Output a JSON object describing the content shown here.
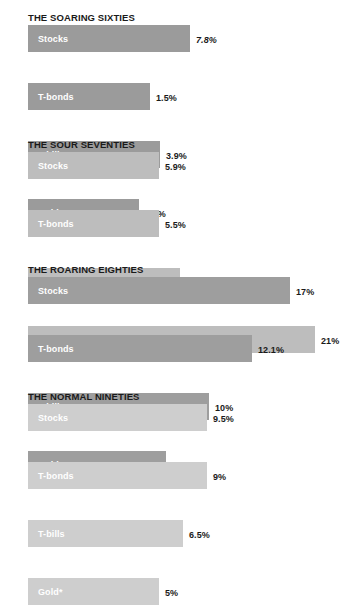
{
  "chart_data": {
    "type": "bar",
    "title": "",
    "xlabel": "",
    "ylabel": "",
    "orientation": "horizontal",
    "grid": false,
    "legend": "none",
    "note": "Four decade panels; each panel lists annualized returns for four asset classes. Bar lengths are drawn per-panel and are not on a single shared scale.",
    "categories": [
      "Stocks",
      "T-bonds",
      "T-bills",
      "Gold"
    ],
    "panels": [
      {
        "title": "THE SOARING SIXTIES",
        "bar_color": "#9b9b9b",
        "bars": [
          {
            "label": "Stocks",
            "value": 7.8,
            "value_label": "7.8%",
            "italic": true,
            "bar_px": 162,
            "value_x_px": 196
          },
          {
            "label": "T-bonds",
            "value": 1.5,
            "value_label": "1.5%",
            "italic": false,
            "bar_px": 122,
            "value_x_px": 156
          },
          {
            "label": "T-bills",
            "value": 3.9,
            "value_label": "3.9%",
            "italic": false,
            "bar_px": 132,
            "value_x_px": 166
          },
          {
            "label": "Gold*",
            "value": 2.2,
            "value_label": "2.2%",
            "italic": false,
            "bar_px": 111,
            "value_x_px": 145
          }
        ]
      },
      {
        "title": "THE SOUR SEVENTIES",
        "bar_color": "#bdbdbd",
        "bars": [
          {
            "label": "Stocks",
            "value": 5.9,
            "value_label": "5.9%",
            "italic": false,
            "bar_px": 131,
            "value_x_px": 165
          },
          {
            "label": "T-bonds",
            "value": 5.5,
            "value_label": "5.5%",
            "italic": false,
            "bar_px": 131,
            "value_x_px": 165
          },
          {
            "label": "T-bills",
            "value": 6.3,
            "value_label": "6.3%",
            "italic": false,
            "bar_px": 152,
            "value_x_px": 186
          },
          {
            "label": "Gold",
            "value": 21,
            "value_label": "21%",
            "italic": false,
            "bar_px": 287,
            "value_x_px": 321
          }
        ]
      },
      {
        "title": "THE ROARING EIGHTIES",
        "bar_color": "#9e9e9e",
        "bars": [
          {
            "label": "Stocks",
            "value": 17,
            "value_label": "17%",
            "italic": false,
            "bar_px": 262,
            "value_x_px": 296
          },
          {
            "label": "T-bonds",
            "value": 12.1,
            "value_label": "12.1%",
            "italic": false,
            "bar_px": 224,
            "value_x_px": 258
          },
          {
            "label": "T-bills",
            "value": 10,
            "value_label": "10%",
            "italic": false,
            "bar_px": 181,
            "value_x_px": 215
          },
          {
            "label": "Gold",
            "value": 2.8,
            "value_label": "2.8%",
            "italic": false,
            "bar_px": 138,
            "value_x_px": 172
          }
        ]
      },
      {
        "title": "THE NORMAL NINETIES",
        "bar_color": "#cecece",
        "bars": [
          {
            "label": "Stocks",
            "value": 9.5,
            "value_label": "9.5%",
            "italic": false,
            "bar_px": 179,
            "value_x_px": 213
          },
          {
            "label": "T-bonds",
            "value": 9,
            "value_label": "9%",
            "italic": false,
            "bar_px": 179,
            "value_x_px": 213
          },
          {
            "label": "T-bills",
            "value": 6.5,
            "value_label": "6.5%",
            "italic": false,
            "bar_px": 155,
            "value_x_px": 189
          },
          {
            "label": "Gold*",
            "value": 5,
            "value_label": "5%",
            "italic": false,
            "bar_px": 131,
            "value_x_px": 165
          }
        ]
      }
    ]
  }
}
